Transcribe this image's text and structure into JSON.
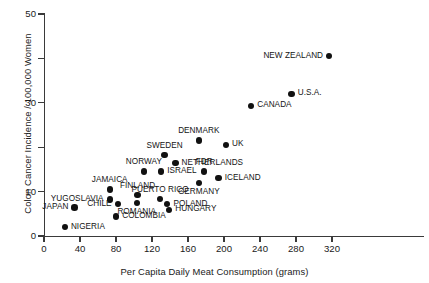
{
  "chart_data": {
    "type": "scatter",
    "title": "",
    "xlabel": "Per Capita Daily Meat Consumption (grams)",
    "ylabel": "Colon Cancer Incidence / 100,000 Women",
    "xlim": [
      0,
      340
    ],
    "ylim": [
      0,
      50
    ],
    "xticks": [
      0,
      40,
      80,
      120,
      160,
      200,
      240,
      280,
      320
    ],
    "yticks": [
      0,
      10,
      20,
      30,
      40,
      50
    ],
    "ytick_labels": [
      "0",
      "10",
      "",
      "30",
      "",
      "50"
    ],
    "grid": false,
    "legend": null,
    "points": [
      {
        "label": "NIGERIA",
        "x": 23,
        "y": 2.0,
        "label_pos": "right"
      },
      {
        "label": "JAPAN",
        "x": 34,
        "y": 6.4,
        "label_pos": "left"
      },
      {
        "label": "YUGOSLAVIA",
        "x": 73,
        "y": 8.2,
        "label_pos": "left"
      },
      {
        "label": "JAMAICA",
        "x": 73,
        "y": 10.5,
        "label_pos": "above"
      },
      {
        "label": "CHILE",
        "x": 82,
        "y": 7.2,
        "label_pos": "left"
      },
      {
        "label": "COLOMBIA",
        "x": 80,
        "y": 4.4,
        "label_pos": "right"
      },
      {
        "label": "FINLAND",
        "x": 104,
        "y": 9.3,
        "label_pos": "above"
      },
      {
        "label": "ROMANIA",
        "x": 103,
        "y": 7.5,
        "label_pos": "below"
      },
      {
        "label": "NORWAY",
        "x": 111,
        "y": 14.5,
        "label_pos": "above"
      },
      {
        "label": "PUERTO RICO",
        "x": 129,
        "y": 8.4,
        "label_pos": "above"
      },
      {
        "label": "ISRAEL",
        "x": 130,
        "y": 14.5,
        "label_pos": "right"
      },
      {
        "label": "POLAND",
        "x": 137,
        "y": 7.2,
        "label_pos": "right"
      },
      {
        "label": "HUNGARY",
        "x": 139,
        "y": 5.9,
        "label_pos": "right"
      },
      {
        "label": "SWEDEN",
        "x": 134,
        "y": 18.2,
        "label_pos": "above"
      },
      {
        "label": "NETHERLANDS",
        "x": 146,
        "y": 16.4,
        "label_pos": "right"
      },
      {
        "label": "DENMARK",
        "x": 172,
        "y": 21.5,
        "label_pos": "above"
      },
      {
        "label": "GERMANY",
        "x": 172,
        "y": 12.0,
        "label_pos": "below"
      },
      {
        "label": "FDR",
        "x": 178,
        "y": 14.5,
        "label_pos": "above"
      },
      {
        "label": "ICELAND",
        "x": 194,
        "y": 13.0,
        "label_pos": "right"
      },
      {
        "label": "UK",
        "x": 202,
        "y": 20.5,
        "label_pos": "right"
      },
      {
        "label": "CANADA",
        "x": 230,
        "y": 29.3,
        "label_pos": "right"
      },
      {
        "label": "U.S.A.",
        "x": 275,
        "y": 32.0,
        "label_pos": "right"
      },
      {
        "label": "NEW ZEALAND",
        "x": 317,
        "y": 40.5,
        "label_pos": "left"
      }
    ]
  }
}
